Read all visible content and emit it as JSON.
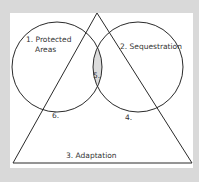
{
  "diagram": {
    "type": "venn-with-triangle",
    "colors": {
      "background": "#d9d9d9",
      "panel": "#ffffff",
      "stroke": "#2a2a2a",
      "overlap_fill": "#dcdcdc"
    },
    "sets": [
      {
        "id": "1",
        "label_line1": "1. Protected",
        "label_line2": "Areas",
        "shape": "circle"
      },
      {
        "id": "2",
        "label": "2. Sequestration",
        "shape": "circle"
      },
      {
        "id": "3",
        "label": "3. Adaptation",
        "shape": "triangle"
      }
    ],
    "regions": [
      {
        "id": "4",
        "label": "4."
      },
      {
        "id": "5",
        "label": "5."
      },
      {
        "id": "6",
        "label": "6."
      }
    ]
  }
}
